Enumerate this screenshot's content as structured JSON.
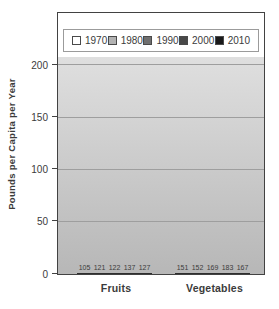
{
  "chart_data": {
    "type": "bar",
    "title": "",
    "categories": [
      "Fruits",
      "Vegetables"
    ],
    "series": [
      {
        "name": "1970",
        "color": "#ffffff",
        "values": [
          105,
          151
        ]
      },
      {
        "name": "1980",
        "color": "#b2b2b2",
        "values": [
          121,
          152
        ]
      },
      {
        "name": "1990",
        "color": "#6f6f6f",
        "values": [
          122,
          169
        ]
      },
      {
        "name": "2000",
        "color": "#484848",
        "values": [
          137,
          183
        ]
      },
      {
        "name": "2010",
        "color": "#1a1a1a",
        "values": [
          127,
          167
        ]
      }
    ],
    "xlabel": "",
    "ylabel": "Pounds per Capita per Year",
    "yticks": [
      0,
      50,
      100,
      150,
      200
    ],
    "ylim": [
      0,
      208
    ],
    "grid": true,
    "legend_position": "top-inside",
    "show_value_labels": true
  },
  "colors": {
    "frame_border": "#424242",
    "legend_border": "#9b9b9b",
    "plot_bg_top": "#dfdfdf",
    "plot_bg_bottom": "#b7b7b7",
    "gridline": "#9e9e9e",
    "bar_border": "#2d2d2d",
    "text": "#3b3b3b"
  }
}
